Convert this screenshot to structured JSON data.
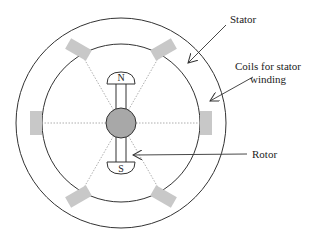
{
  "diagram": {
    "type": "stator-rotor-cross-section",
    "colors": {
      "line": "#333333",
      "coil": "#c8c8c8",
      "rotor_core": "#a8a8a8",
      "dotted": "#999999"
    },
    "labels": {
      "stator": "Stator",
      "coils_line1": "Coils for stator",
      "coils_line2": "winding",
      "rotor": "Rotor"
    },
    "poles": {
      "north": "N",
      "south": "S"
    },
    "coil_angles_deg": [
      0,
      60,
      120,
      180,
      240,
      300
    ]
  }
}
